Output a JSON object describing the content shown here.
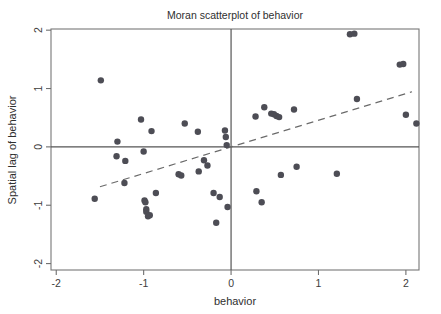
{
  "chart_data": {
    "type": "scatter",
    "title": "Moran scatterplot of behavior",
    "xlabel": "behavior",
    "ylabel": "Spatial lag of behavior",
    "xlim": [
      -2.06,
      2.15
    ],
    "ylim": [
      -2.11,
      2.02
    ],
    "xticks": [
      -2,
      -1,
      0,
      1,
      2
    ],
    "yticks": [
      -2,
      -1,
      0,
      1,
      2
    ],
    "xtick_labels": [
      "-2",
      "-1",
      "0",
      "1",
      "2"
    ],
    "ytick_labels": [
      "-2",
      "-1",
      "0",
      "1",
      "2"
    ],
    "grid": false,
    "legend": null,
    "marker_color": "#4d4d55",
    "marker_size": 3.2,
    "reference_lines": [
      {
        "name": "horizontal-mean-line",
        "axis": "y",
        "value": 0,
        "style": "solid",
        "color": "#555555"
      },
      {
        "name": "vertical-mean-line",
        "axis": "x",
        "value": 0,
        "style": "solid",
        "color": "#555555"
      }
    ],
    "fit_line": {
      "name": "moran-fit-line",
      "style": "dashed",
      "color": "#6b6b6b",
      "slope": 0.456,
      "intercept": 0.0,
      "x_start": -1.5,
      "x_end": 2.07
    },
    "points": [
      {
        "x": -1.56,
        "y": -0.89
      },
      {
        "x": -1.49,
        "y": 1.14
      },
      {
        "x": -1.3,
        "y": 0.09
      },
      {
        "x": -1.31,
        "y": -0.16
      },
      {
        "x": -1.22,
        "y": -0.62
      },
      {
        "x": -1.21,
        "y": -0.24
      },
      {
        "x": -1.03,
        "y": 0.47
      },
      {
        "x": -1.0,
        "y": -0.08
      },
      {
        "x": -0.99,
        "y": -0.92
      },
      {
        "x": -0.98,
        "y": -0.95
      },
      {
        "x": -0.97,
        "y": -1.07
      },
      {
        "x": -0.97,
        "y": -1.11
      },
      {
        "x": -0.95,
        "y": -1.19
      },
      {
        "x": -0.93,
        "y": -1.17
      },
      {
        "x": -0.91,
        "y": 0.27
      },
      {
        "x": -0.86,
        "y": -0.79
      },
      {
        "x": -0.6,
        "y": -0.47
      },
      {
        "x": -0.57,
        "y": -0.49
      },
      {
        "x": -0.53,
        "y": 0.4
      },
      {
        "x": -0.38,
        "y": 0.26
      },
      {
        "x": -0.37,
        "y": -0.42
      },
      {
        "x": -0.31,
        "y": -0.23
      },
      {
        "x": -0.27,
        "y": -0.32
      },
      {
        "x": -0.2,
        "y": -0.79
      },
      {
        "x": -0.17,
        "y": -1.3
      },
      {
        "x": -0.13,
        "y": -0.86
      },
      {
        "x": -0.07,
        "y": 0.28
      },
      {
        "x": -0.06,
        "y": 0.17
      },
      {
        "x": -0.05,
        "y": 0.03
      },
      {
        "x": -0.04,
        "y": -1.03
      },
      {
        "x": 0.28,
        "y": 0.52
      },
      {
        "x": 0.29,
        "y": -0.76
      },
      {
        "x": 0.35,
        "y": -0.95
      },
      {
        "x": 0.38,
        "y": 0.68
      },
      {
        "x": 0.46,
        "y": 0.57
      },
      {
        "x": 0.49,
        "y": 0.56
      },
      {
        "x": 0.52,
        "y": 0.53
      },
      {
        "x": 0.55,
        "y": 0.51
      },
      {
        "x": 0.57,
        "y": -0.48
      },
      {
        "x": 0.72,
        "y": 0.64
      },
      {
        "x": 0.75,
        "y": -0.34
      },
      {
        "x": 1.21,
        "y": -0.46
      },
      {
        "x": 1.36,
        "y": 1.93
      },
      {
        "x": 1.41,
        "y": 1.94
      },
      {
        "x": 1.44,
        "y": 0.82
      },
      {
        "x": 1.93,
        "y": 1.41
      },
      {
        "x": 1.97,
        "y": 1.42
      },
      {
        "x": 2.0,
        "y": 0.55
      },
      {
        "x": 2.12,
        "y": 0.4
      }
    ]
  },
  "figure": {
    "title": "Moran scatterplot of behavior"
  }
}
